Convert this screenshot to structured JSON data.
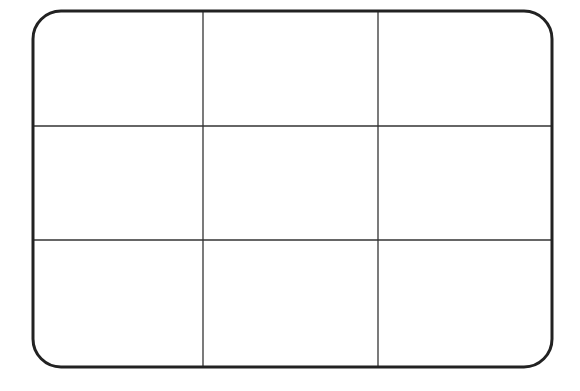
{
  "diagram": {
    "type": "grid",
    "rows": 3,
    "columns": 3,
    "frame": {
      "x": 33,
      "y": 11,
      "width": 519,
      "height": 356,
      "corner_radius": 28,
      "stroke_width": 3,
      "stroke_color": "#222222"
    },
    "grid_lines": {
      "vertical_x": [
        203,
        378
      ],
      "horizontal_y": [
        126,
        240
      ],
      "stroke_width": 1.3,
      "stroke_color": "#333333"
    },
    "background_color": "#ffffff"
  }
}
